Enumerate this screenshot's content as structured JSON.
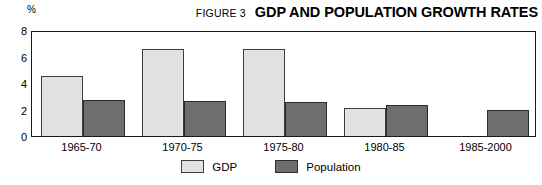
{
  "header": {
    "figure_number": "FIGURE 3",
    "title": "GDP AND POPULATION GROWTH RATES",
    "unit_label": "%"
  },
  "colors": {
    "gdp": "#e2e2e2",
    "population": "#6e6e6e",
    "axis": "#1a1a1a",
    "background": "#ffffff"
  },
  "chart_data": {
    "type": "bar",
    "title": "GDP AND POPULATION GROWTH RATES",
    "subtitle": "FIGURE 3",
    "xlabel": "",
    "ylabel": "%",
    "ylim": [
      0,
      8
    ],
    "yticks": [
      0,
      2,
      4,
      6,
      8
    ],
    "grid": false,
    "legend_position": "bottom-center",
    "categories": [
      "1965-70",
      "1970-75",
      "1975-80",
      "1980-85",
      "1985-2000"
    ],
    "series": [
      {
        "name": "GDP",
        "color": "#e2e2e2",
        "values": [
          4.5,
          6.6,
          6.6,
          2.15,
          null
        ]
      },
      {
        "name": "Population",
        "color": "#6e6e6e",
        "values": [
          2.7,
          2.65,
          2.6,
          2.35,
          2.0
        ]
      }
    ]
  },
  "legend": [
    {
      "label": "GDP",
      "swatch": "gdp"
    },
    {
      "label": "Population",
      "swatch": "pop"
    }
  ],
  "y_ticks": [
    "8",
    "6",
    "4",
    "2",
    "0"
  ]
}
